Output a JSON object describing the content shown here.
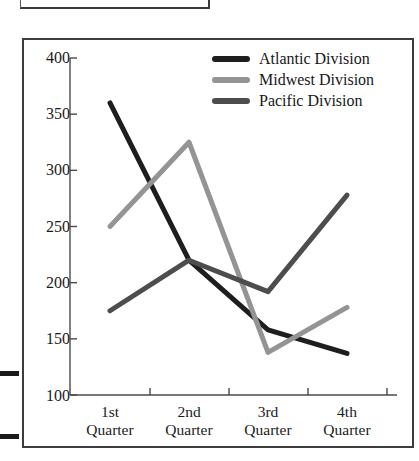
{
  "chart_data": {
    "type": "line",
    "title": "",
    "xlabel": "",
    "ylabel": "",
    "categories": [
      "1st Quarter",
      "2nd Quarter",
      "3rd Quarter",
      "4th Quarter"
    ],
    "x_tick_labels": [
      {
        "line1": "1st",
        "line2": "Quarter"
      },
      {
        "line1": "2nd",
        "line2": "Quarter"
      },
      {
        "line1": "3rd",
        "line2": "Quarter"
      },
      {
        "line1": "4th",
        "line2": "Quarter"
      }
    ],
    "y_tick_labels": [
      "400",
      "350",
      "300",
      "250",
      "200",
      "150",
      "100"
    ],
    "y_ticks": [
      400,
      350,
      300,
      250,
      200,
      150,
      100
    ],
    "ylim": [
      100,
      400
    ],
    "grid": false,
    "legend_position": "top-right",
    "series": [
      {
        "name": "Atlantic Division",
        "color": "#1e1e1e",
        "values": [
          360,
          220,
          158,
          137
        ]
      },
      {
        "name": "Midwest Division",
        "color": "#949494",
        "values": [
          250,
          325,
          138,
          178
        ]
      },
      {
        "name": "Pacific Division",
        "color": "#4d4d4f",
        "values": [
          175,
          220,
          192,
          278
        ]
      }
    ]
  },
  "legend": {
    "entries": [
      {
        "label": "Atlantic Division"
      },
      {
        "label": "Midwest Division"
      },
      {
        "label": "Pacific Division"
      }
    ]
  },
  "colors": {
    "axis": "#4a4a4c",
    "frame": "#3c3c3e",
    "text": "#1b1b1b",
    "background": "#ffffff"
  }
}
